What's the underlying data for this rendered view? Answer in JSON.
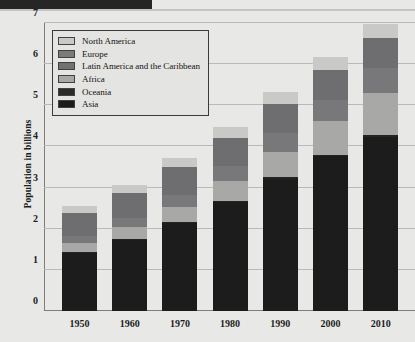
{
  "page": {
    "background_color": "#e8e8e6",
    "header_band_color": "#262626"
  },
  "chart_data": {
    "type": "bar",
    "stacked": true,
    "title": "",
    "xlabel": "",
    "ylabel": "Population in billions",
    "ylim": [
      0,
      7
    ],
    "yticks": [
      0,
      1,
      2,
      3,
      4,
      5,
      6,
      7
    ],
    "ytick_labels": [
      "0",
      "1",
      "2",
      "3",
      "4",
      "5",
      "6",
      "7"
    ],
    "grid": true,
    "legend_position": "upper-left",
    "categories": [
      "1950",
      "1960",
      "1970",
      "1980",
      "1990",
      "2000",
      "2010"
    ],
    "series": [
      {
        "name": "Asia",
        "color": "#1c1c1c",
        "values": [
          1.42,
          1.74,
          2.15,
          2.66,
          3.22,
          3.76,
          4.24
        ]
      },
      {
        "name": "Oceania",
        "color": "#242424",
        "values": [
          0.013,
          0.016,
          0.019,
          0.023,
          0.027,
          0.031,
          0.037
        ]
      },
      {
        "name": "Africa",
        "color": "#a8a8a6",
        "values": [
          0.23,
          0.29,
          0.37,
          0.48,
          0.63,
          0.82,
          1.03
        ]
      },
      {
        "name": "Latin America and the Caribbean",
        "color": "#78787a",
        "values": [
          0.17,
          0.22,
          0.29,
          0.36,
          0.44,
          0.52,
          0.59
        ]
      },
      {
        "name": "Europe",
        "color": "#6e6e70",
        "values": [
          0.55,
          0.6,
          0.66,
          0.69,
          0.72,
          0.73,
          0.74
        ]
      },
      {
        "name": "North America",
        "color": "#c9c9c7",
        "values": [
          0.17,
          0.2,
          0.23,
          0.25,
          0.28,
          0.31,
          0.34
        ]
      }
    ],
    "totals": [
      2.45,
      3.02,
      3.71,
      4.47,
      5.32,
      6.15,
      6.96
    ],
    "annotations": []
  },
  "legend": {
    "items": [
      {
        "label": "North America",
        "color": "#c9c9c7"
      },
      {
        "label": "Europe",
        "color": "#7b7b7d"
      },
      {
        "label": "Latin America and the Caribbean",
        "color": "#727274"
      },
      {
        "label": "Africa",
        "color": "#a8a8a6"
      },
      {
        "label": "Oceania",
        "color": "#2b2b2b"
      },
      {
        "label": "Asia",
        "color": "#1c1c1c"
      }
    ]
  }
}
